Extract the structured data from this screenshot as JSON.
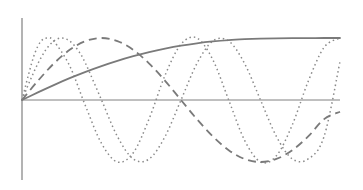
{
  "chart_data": {
    "type": "line",
    "title": "",
    "subtitle": "",
    "xlabel": "",
    "ylabel": "",
    "grid": false,
    "legend": "none",
    "background_color": "#ffffff",
    "axis_color": "#808080",
    "xlim": [
      0,
      1
    ],
    "ylim": [
      -1.15,
      1.15
    ],
    "axes": {
      "x_axis_visible": true,
      "y_axis_visible": true,
      "x_axis_y_value": 0,
      "y_axis_x_value": 0,
      "ticks": [],
      "tick_labels": []
    },
    "series": [
      {
        "name": "monotonic-concave",
        "style": "solid",
        "color": "#7a7a7a",
        "width": 1.8,
        "dash": "none",
        "x": [
          0,
          0.05,
          0.1,
          0.15,
          0.2,
          0.25,
          0.3,
          0.35,
          0.4,
          0.45,
          0.5,
          0.55,
          0.6,
          0.65,
          0.7,
          0.75,
          0.8,
          0.85,
          0.9,
          0.95,
          1
        ],
        "y": [
          0,
          0.123,
          0.241,
          0.352,
          0.454,
          0.547,
          0.631,
          0.706,
          0.772,
          0.829,
          0.877,
          0.915,
          0.945,
          0.967,
          0.981,
          0.99,
          0.995,
          0.998,
          0.999,
          1,
          1
        ]
      },
      {
        "name": "wave-1-cycle",
        "style": "long-dash",
        "color": "#7a7a7a",
        "width": 1.8,
        "dash": "8 5",
        "x": [
          0,
          0.05,
          0.1,
          0.15,
          0.2,
          0.25,
          0.3,
          0.35,
          0.4,
          0.45,
          0.5,
          0.55,
          0.6,
          0.65,
          0.7,
          0.75,
          0.8,
          0.85,
          0.9,
          0.95,
          1
        ],
        "y": [
          0,
          0.309,
          0.588,
          0.809,
          0.951,
          1.0,
          0.951,
          0.809,
          0.588,
          0.309,
          0,
          -0.309,
          -0.588,
          -0.809,
          -0.951,
          -1.0,
          -0.951,
          -0.809,
          -0.588,
          -0.309,
          -0.19
        ]
      },
      {
        "name": "wave-2-cycles",
        "style": "dotted",
        "color": "#8a8a8a",
        "width": 1.5,
        "dash": "1.5 3",
        "x": [
          0,
          0.025,
          0.05,
          0.075,
          0.1,
          0.125,
          0.15,
          0.175,
          0.2,
          0.25,
          0.3,
          0.35,
          0.4,
          0.45,
          0.5,
          0.55,
          0.6,
          0.65,
          0.7,
          0.75,
          0.8,
          0.85,
          0.9,
          0.95,
          1
        ],
        "y": [
          0,
          0.309,
          0.588,
          0.809,
          0.951,
          1.0,
          0.951,
          0.809,
          0.588,
          0,
          -0.588,
          -0.951,
          -0.951,
          -0.588,
          0,
          0.588,
          0.951,
          0.951,
          0.588,
          0,
          -0.588,
          -0.951,
          -0.951,
          -0.588,
          0.62
        ]
      },
      {
        "name": "wave-3-cycles",
        "style": "fine-dotted",
        "color": "#8a8a8a",
        "width": 1.5,
        "dash": "1.5 3",
        "x": [
          0,
          0.02,
          0.04,
          0.06,
          0.08,
          0.1,
          0.15,
          0.2,
          0.25,
          0.3,
          0.35,
          0.4,
          0.45,
          0.5,
          0.55,
          0.6,
          0.65,
          0.7,
          0.75,
          0.8,
          0.85,
          0.9,
          0.95,
          1
        ],
        "y": [
          0,
          0.4,
          0.75,
          0.95,
          1.0,
          0.95,
          0.55,
          -0.1,
          -0.7,
          -1.0,
          -0.85,
          -0.3,
          0.4,
          0.9,
          1.0,
          0.65,
          0.0,
          -0.65,
          -1.0,
          -0.9,
          -0.4,
          0.3,
          0.85,
          1.0
        ]
      }
    ]
  },
  "figure": {
    "plot_area": {
      "origin_x_px": 22,
      "origin_y_px": 100,
      "right_px": 340,
      "top_px": 18,
      "bottom_px": 180,
      "amplitude_px": 62
    }
  }
}
